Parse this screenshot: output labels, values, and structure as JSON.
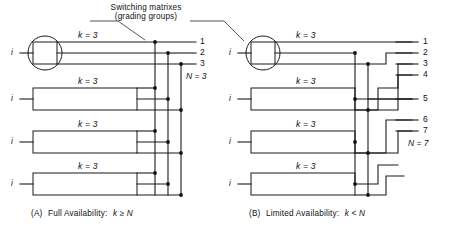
{
  "figure": {
    "annotation": {
      "line1": "Switching matrixes",
      "line2": "(grading groups)"
    },
    "panels": [
      {
        "id": "A",
        "caption_prefix": "(A)",
        "caption_text": "Full Availability:",
        "caption_math": "k ≥ N",
        "k_label": "k = 3",
        "k_labels": [
          "k = 3",
          "k = 3",
          "k = 3",
          "k = 3"
        ],
        "input_label": "i",
        "input_labels": [
          "i",
          "i",
          "i",
          "i"
        ],
        "outputs": [
          "1",
          "2",
          "3"
        ],
        "N_label": "N = 3",
        "matrix_count": 4,
        "outlets_per_matrix": 3
      },
      {
        "id": "B",
        "caption_prefix": "(B)",
        "caption_text": "Limited Availability:",
        "caption_math": "k < N",
        "k_label": "k = 3",
        "k_labels": [
          "k = 3",
          "k = 3",
          "k = 3",
          "k = 3"
        ],
        "input_label": "i",
        "input_labels": [
          "i",
          "i",
          "i",
          "i"
        ],
        "outputs": [
          "1",
          "2",
          "3",
          "4",
          "5",
          "6",
          "7"
        ],
        "N_label": "N = 7",
        "matrix_count": 4,
        "outlets_per_matrix": 3
      }
    ],
    "colors": {
      "ink": "#1a1a1a",
      "background": "#ffffff"
    }
  }
}
